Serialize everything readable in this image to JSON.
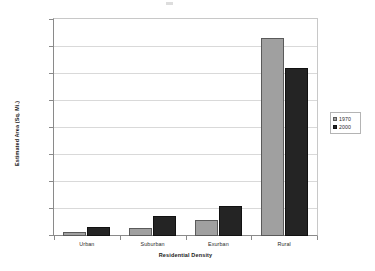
{
  "chart_data": {
    "type": "bar",
    "title": "",
    "xlabel": "Residential Density",
    "ylabel": "Estimated Area (Sq. Mi.)",
    "categories": [
      "Urban",
      "Suburban",
      "Exurban",
      "Rural"
    ],
    "series": [
      {
        "name": "1970",
        "color": "#a0a0a0",
        "values": [
          800,
          1400,
          3000,
          36700
        ]
      },
      {
        "name": "2000",
        "color": "#242424",
        "values": [
          1600,
          3700,
          5500,
          31200
        ]
      }
    ],
    "ylim": [
      0,
      40000
    ],
    "yticks": [
      0,
      5000,
      10000,
      15000,
      20000,
      25000,
      30000,
      35000,
      40000
    ],
    "ytick_labels": [
      "0",
      "5,000",
      "10,000",
      "15,000",
      "20,000",
      "25,000",
      "30,000",
      "35,000",
      "40,000"
    ],
    "grid": true,
    "legend_position": "right",
    "legend_entries": [
      "1970",
      "2000"
    ]
  },
  "axes": {
    "y_title": "Estimated Area (Sq. Mi.)",
    "x_title": "Residential Density"
  },
  "legend": {
    "items": [
      {
        "label": "1970"
      },
      {
        "label": "2000"
      }
    ]
  }
}
